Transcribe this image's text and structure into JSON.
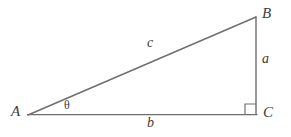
{
  "figure": {
    "kind": "right-triangle-diagram",
    "background_color": "#ffffff",
    "stroke_color": "#6e6e6e",
    "text_color": "#3b3b3b",
    "vertices": {
      "A": {
        "label": "A",
        "x": 28,
        "y": 115
      },
      "B": {
        "label": "B",
        "x": 256,
        "y": 17
      },
      "C": {
        "label": "C",
        "x": 256,
        "y": 114
      }
    },
    "sides": {
      "a": {
        "label": "a",
        "from": "B",
        "to": "C",
        "description": "opposite-side-vertical"
      },
      "b": {
        "label": "b",
        "from": "A",
        "to": "C",
        "description": "adjacent-side-horizontal"
      },
      "c": {
        "label": "c",
        "from": "A",
        "to": "B",
        "description": "hypotenuse"
      }
    },
    "angle": {
      "label": "θ",
      "at_vertex": "A"
    },
    "right_angle": {
      "at_vertex": "C",
      "marker": "square",
      "size": 10
    }
  }
}
